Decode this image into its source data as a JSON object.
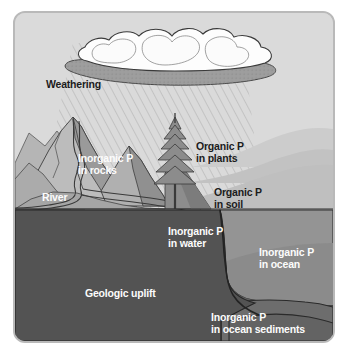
{
  "figure": {
    "frame": {
      "border_color": "#b9b9b9",
      "background_color": "#d8d8d8"
    }
  },
  "palette": {
    "sky": "#dadada",
    "far_hill": "#c9c9c9",
    "near_hill": "#bdbdbd",
    "mountain_light": "#c2c2c2",
    "mountain_mid": "#a8a8a8",
    "mountain_dark": "#8e8e8e",
    "mountain_shadow": "#7d7d7d",
    "soil_slope": "#8a8a8a",
    "ocean_surface": "#9a9a9a",
    "ocean_shelf": "#8f8f8f",
    "water_deep": "#5b5b5b",
    "bedrock": "#545454",
    "sediment": "#6a6a6a",
    "cloud_white": "#fdfdfd",
    "cloud_underside": "#9d9d9d",
    "outline": "#2d2d2d",
    "label_dark": "#1c1c1c",
    "label_light": "#fcfcfc"
  },
  "labels": [
    {
      "id": "weathering",
      "text": "Weathering",
      "tone": "dark",
      "x": 31,
      "y": 66
    },
    {
      "id": "inorganic-p-in-rocks",
      "text": "Inorganic P\nin rocks",
      "tone": "light",
      "x": 63,
      "y": 140
    },
    {
      "id": "river",
      "text": "River",
      "tone": "light",
      "x": 27,
      "y": 179
    },
    {
      "id": "organic-p-in-plants",
      "text": "Organic P\nin plants",
      "tone": "dark",
      "x": 181,
      "y": 128
    },
    {
      "id": "organic-p-in-soil",
      "text": "Organic P\nin soil",
      "tone": "dark",
      "x": 199,
      "y": 174
    },
    {
      "id": "inorganic-p-in-water",
      "text": "Inorganic P\nin water",
      "tone": "light",
      "x": 153,
      "y": 213
    },
    {
      "id": "inorganic-p-in-ocean",
      "text": "Inorganic P\nin ocean",
      "tone": "light",
      "x": 244,
      "y": 234
    },
    {
      "id": "geologic-uplift",
      "text": "Geologic uplift",
      "tone": "light",
      "x": 70,
      "y": 275
    },
    {
      "id": "inorganic-p-in-ocean-sediments",
      "text": "Inorganic P\nin ocean sediments",
      "tone": "light",
      "x": 196,
      "y": 299
    }
  ],
  "elements": [
    {
      "id": "cloud",
      "name": "cloud-shape"
    },
    {
      "id": "rain",
      "name": "rain-hatching"
    },
    {
      "id": "mountain-range",
      "name": "mountain-range"
    },
    {
      "id": "river-path",
      "name": "river-path"
    },
    {
      "id": "conifer-tree",
      "name": "conifer-tree"
    },
    {
      "id": "rolling-hills",
      "name": "rolling-hills"
    },
    {
      "id": "soil-slope",
      "name": "soil-slope"
    },
    {
      "id": "ocean-body",
      "name": "ocean-body"
    },
    {
      "id": "continental-shelf",
      "name": "continental-shelf"
    },
    {
      "id": "bedrock",
      "name": "bedrock-layer"
    },
    {
      "id": "ocean-sediments",
      "name": "ocean-sediment-layers"
    }
  ]
}
